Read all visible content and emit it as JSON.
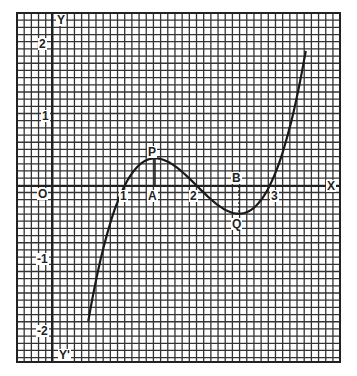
{
  "chart_data": {
    "type": "line",
    "title": "",
    "function": "y = (x-1)(x-2)(x-3)",
    "x_range": [
      0.5,
      3.5
    ],
    "xlim": [
      -0.5,
      4.0
    ],
    "ylim": [
      -2.45,
      2.4
    ],
    "grid": true,
    "grid_step": 0.1,
    "axis_labels": {
      "x_pos": "X",
      "y_pos": "Y",
      "y_neg": "Y'",
      "origin": "O"
    },
    "x_ticks": [
      "1",
      "2",
      "3"
    ],
    "y_ticks": [
      "2",
      "1",
      "-1",
      "-2"
    ],
    "series": [
      {
        "name": "curve",
        "x": [
          0.5,
          0.75,
          1.0,
          1.25,
          1.42,
          1.5,
          1.75,
          2.0,
          2.25,
          2.5,
          2.58,
          2.75,
          3.0,
          3.25,
          3.5
        ],
        "y": [
          -1.875,
          -0.703,
          0.0,
          0.328,
          0.385,
          0.375,
          0.234,
          0.0,
          -0.234,
          -0.375,
          -0.385,
          -0.328,
          0.0,
          0.703,
          1.875
        ]
      }
    ],
    "annotations": [
      {
        "label": "P",
        "x": 1.42,
        "y": 0.385,
        "note": "local maximum"
      },
      {
        "label": "A",
        "x": 1.42,
        "y": 0,
        "note": "foot of perpendicular from P"
      },
      {
        "label": "Q",
        "x": 2.58,
        "y": -0.385,
        "note": "local minimum"
      },
      {
        "label": "B",
        "x": 2.58,
        "y": 0,
        "note": "foot of perpendicular from Q"
      }
    ]
  }
}
